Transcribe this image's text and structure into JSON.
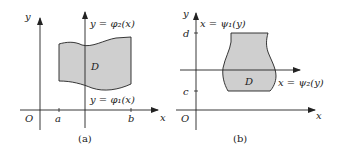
{
  "colors": {
    "region_fill": "#cfcfcf",
    "stroke": "#222222",
    "background": "#ffffff"
  },
  "panel_a": {
    "caption": "(a)",
    "axis_y_label": "y",
    "axis_x_label": "x",
    "origin_label": "O",
    "tick_a": "a",
    "tick_b": "b",
    "region_label": "D",
    "upper_curve_label": "y = φ₂(x)",
    "lower_curve_label": "y = φ₁(x)"
  },
  "panel_b": {
    "caption": "(b)",
    "axis_y_label": "y",
    "axis_x_label": "x",
    "origin_label": "O",
    "tick_c": "c",
    "tick_d": "d",
    "region_label": "D",
    "left_curve_label": "x = ψ₁(y)",
    "right_curve_label": "x = ψ₂(y)"
  }
}
